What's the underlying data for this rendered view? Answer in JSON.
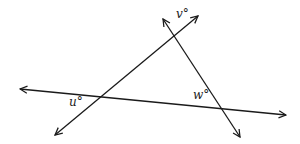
{
  "diagram": {
    "type": "geometry-lines",
    "labels": {
      "u": "u°",
      "v": "v°",
      "w": "w°"
    },
    "lines": [
      {
        "id": "line-horizontal",
        "arrows": "both"
      },
      {
        "id": "line-uv",
        "arrows": "both"
      },
      {
        "id": "line-w",
        "arrows": "both"
      }
    ],
    "stroke_color": "#1a1a1a"
  }
}
